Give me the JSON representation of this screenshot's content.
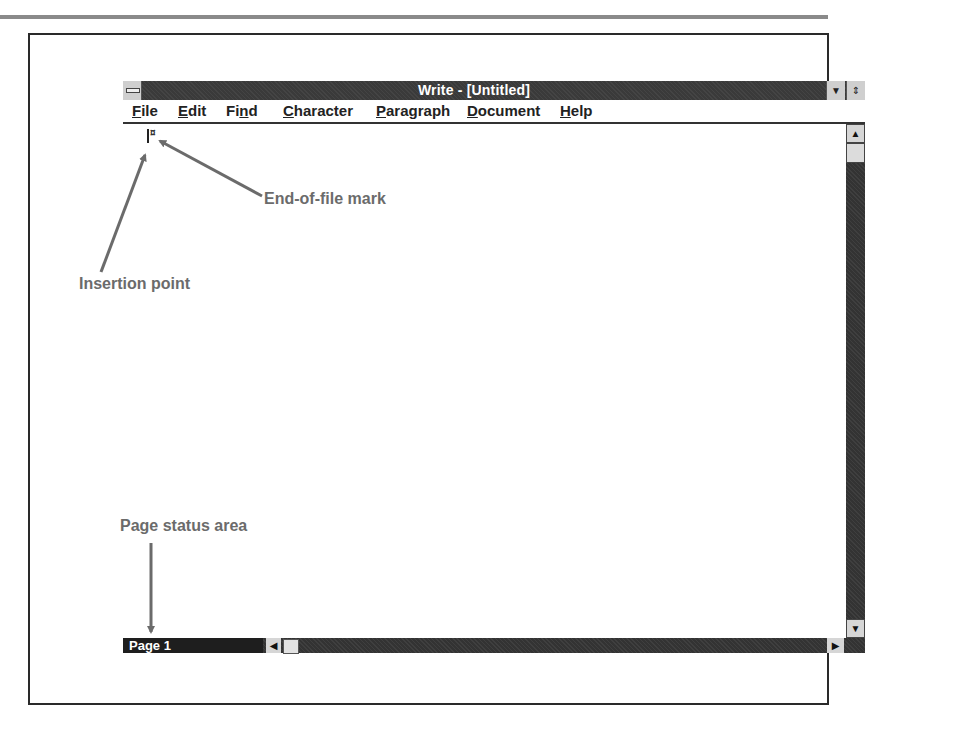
{
  "window": {
    "title": "Write - [Untitled]",
    "controls": {
      "system_menu": "system-menu",
      "minimize_glyph": "▼",
      "maximize_glyph": "⇕"
    }
  },
  "menubar": {
    "items": [
      {
        "label": "File",
        "accel": "F",
        "rest": "ile"
      },
      {
        "label": "Edit",
        "accel": "E",
        "rest": "dit"
      },
      {
        "label": "Find",
        "pre": "Fi",
        "accel": "n",
        "rest": "d"
      },
      {
        "label": "Character",
        "accel": "C",
        "rest": "haracter"
      },
      {
        "label": "Paragraph",
        "accel": "P",
        "rest": "aragraph"
      },
      {
        "label": "Document",
        "accel": "D",
        "rest": "ocument"
      },
      {
        "label": "Help",
        "accel": "H",
        "rest": "elp"
      }
    ]
  },
  "document": {
    "eof_mark": "¤"
  },
  "scrollbars": {
    "up_glyph": "▲",
    "down_glyph": "▼",
    "left_glyph": "◀",
    "right_glyph": "▶"
  },
  "status": {
    "page_label": "Page 1"
  },
  "callouts": {
    "end_of_file": "End-of-file mark",
    "insertion_point": "Insertion point",
    "page_status": "Page status area",
    "color": "#6b6b6b"
  }
}
